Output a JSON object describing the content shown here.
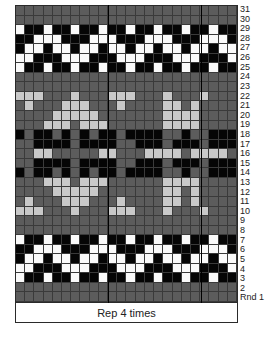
{
  "chart_title": "",
  "repeat_label": "Rep 4 times",
  "row_labels": [
    "31",
    "30",
    "29",
    "28",
    "27",
    "26",
    "25",
    "24",
    "23",
    "22",
    "21",
    "20",
    "19",
    "18",
    "17",
    "16",
    "15",
    "14",
    "13",
    "12",
    "11",
    "10",
    "9",
    "8",
    "7",
    "6",
    "5",
    "4",
    "3",
    "2",
    "Rnd 1"
  ],
  "colors": {
    "D": "#5c5c5c",
    "L": "#c9c9c9",
    "B": "#050505",
    "W": "#fafafa"
  },
  "legend": {
    "D": "dark gray",
    "L": "light gray",
    "B": "black",
    "W": "white"
  },
  "columns": 24,
  "thick_column_lines": [
    10,
    20
  ],
  "grid": [
    "DDDDDDDDDDDDDDDDDDDDDDDD",
    "DDDDDDDDDDDDDDDDDDDDDDDD",
    "WBBWBBWBBWBBWBBWBBWBBWBB",
    "BBWWWBBBWWWBBBWWWBBBWWWB",
    "BWWBWWBWWBWWBWWBWWBWWBWW",
    "WWBBBWWWBBBWWWBBBWWWBBBW",
    "WBBWBBWBBWBBWBBWBBWBBWBB",
    "DDDDDDDDDDDDDDDDDDDDDDDD",
    "DDDDDDDDDDDDDDDDDDDDDDDD",
    "LLLDDDLDDDLLLDDDLDDDLDDD",
    "DLDDDLLLDDDLDDDDLLDLDDDD",
    "DDDDLLLLLDDDDDDDLLLLDDDD",
    "DDDLLLDLLLDDDDDDLLLLDDDD",
    "BDBBDBDBDBBDBBBBDDBDDBBB",
    "DDBBBBDBBBBDDBBBDBBBDBBB",
    "DDLLDDDDDLLDDDLLLLDLLLLD",
    "DDBBBBDBBBBDDBBBDBBBDBBB",
    "BDBBDBDBDBBDBBBBDDBDDBBB",
    "DDDLLLDLLLDDDDDDLLLLDDDD",
    "DDDDLLLLLDDDDDDDLLDLDDDD",
    "DLDDDLLLDDDLDDDDLLDLDDDD",
    "LLLDDDLDDDLLLDDDLDDDLDDD",
    "DDDDDDDDDDDDDDDDDDDDDDDD",
    "DDDDDDDDDDDDDDDDDDDDDDDD",
    "WBBWBBWBBWBBWBBWBBWBBWBB",
    "BBWWWBBBWWWBBBWWWBBBWWWB",
    "BWWBWWBWWBWWBWWBWWBWWBWW",
    "WWBBBWWWBBBWWWBBBWWWBBBW",
    "WBBWBBWBBWBBWBBWBBWBBWBB",
    "DDDDDDDDDDDDDDDDDDDDDDDD",
    "DDDDDDDDDDDDDDDDDDDDDDDD"
  ]
}
